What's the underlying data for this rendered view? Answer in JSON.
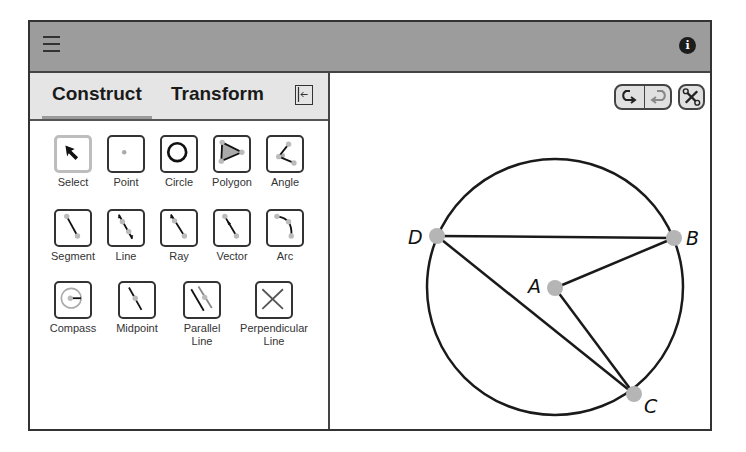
{
  "header": {
    "menu_icon": "hamburger-menu-icon",
    "info_icon_glyph": "i",
    "background_color": "#9c9c9c"
  },
  "sidebar": {
    "tabs": [
      {
        "label": "Construct",
        "active": true
      },
      {
        "label": "Transform",
        "active": false
      }
    ],
    "collapse_icon": "collapse-panel-icon",
    "tools": [
      {
        "label": "Select",
        "icon": "arrow-cursor-icon",
        "selected": true
      },
      {
        "label": "Point",
        "icon": "point-icon",
        "selected": false
      },
      {
        "label": "Circle",
        "icon": "circle-icon",
        "selected": false
      },
      {
        "label": "Polygon",
        "icon": "polygon-icon",
        "selected": false
      },
      {
        "label": "Angle",
        "icon": "angle-icon",
        "selected": false
      },
      {
        "label": "Segment",
        "icon": "segment-icon",
        "selected": false
      },
      {
        "label": "Line",
        "icon": "line-icon",
        "selected": false
      },
      {
        "label": "Ray",
        "icon": "ray-icon",
        "selected": false
      },
      {
        "label": "Vector",
        "icon": "vector-icon",
        "selected": false
      },
      {
        "label": "Arc",
        "icon": "arc-icon",
        "selected": false
      },
      {
        "label": "Compass",
        "icon": "compass-icon",
        "selected": false
      },
      {
        "label": "Midpoint",
        "icon": "midpoint-icon",
        "selected": false
      },
      {
        "label": "Parallel Line",
        "line1": "Parallel",
        "line2": "Line",
        "icon": "parallel-line-icon",
        "selected": false
      },
      {
        "label": "Perpendicular Line",
        "line1": "Perpendicular",
        "line2": "Line",
        "icon": "perpendicular-line-icon",
        "selected": false
      }
    ]
  },
  "canvas": {
    "toolbar": {
      "undo_icon": "undo-icon",
      "redo_icon": "redo-icon",
      "settings_icon": "tools-settings-icon"
    },
    "circle": {
      "center": "A",
      "cx": 227,
      "cy": 214,
      "r": 128
    },
    "points": [
      {
        "name": "A",
        "x": 227,
        "y": 215
      },
      {
        "name": "B",
        "x": 346,
        "y": 165
      },
      {
        "name": "C",
        "x": 306,
        "y": 321
      },
      {
        "name": "D",
        "x": 109,
        "y": 163
      }
    ],
    "segments": [
      [
        "D",
        "B"
      ],
      [
        "A",
        "B"
      ],
      [
        "A",
        "C"
      ],
      [
        "D",
        "C"
      ]
    ],
    "point_color": "#b5b5b5",
    "stroke_color": "#1a1a1a"
  }
}
